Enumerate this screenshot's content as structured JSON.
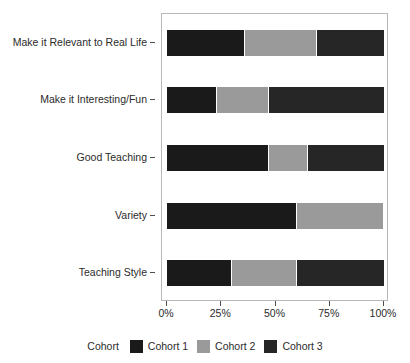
{
  "chart_data": {
    "type": "bar",
    "orientation": "horizontal",
    "stacked": true,
    "normalized_percent": true,
    "title": "",
    "subtitle": "",
    "xlabel": "",
    "ylabel": "",
    "categories": [
      "Make it Relevant to Real Life",
      "Make it Interesting/Fun",
      "Good Teaching",
      "Variety",
      "Teaching Style"
    ],
    "series": [
      {
        "name": "Cohort 1",
        "color": "#1a1a1a",
        "values": [
          36,
          23,
          47,
          60,
          30
        ]
      },
      {
        "name": "Cohort 2",
        "color": "#9a9a9a",
        "values": [
          33,
          24,
          18,
          40,
          30
        ]
      },
      {
        "name": "Cohort 3",
        "color": "#262626",
        "values": [
          31,
          53,
          35,
          0,
          40
        ]
      }
    ],
    "xlim": [
      0,
      100
    ],
    "xticks": [
      0,
      25,
      50,
      75,
      100
    ],
    "xticklabels": [
      "0%",
      "25%",
      "50%",
      "75%",
      "100%"
    ],
    "grid": false,
    "legend": {
      "title": "Cohort",
      "position": "bottom",
      "orientation": "horizontal"
    }
  },
  "legend": {
    "title": "Cohort",
    "entries": [
      {
        "label": "Cohort 1",
        "color": "#1a1a1a"
      },
      {
        "label": "Cohort 2",
        "color": "#9a9a9a"
      },
      {
        "label": "Cohort 3",
        "color": "#262626"
      }
    ]
  },
  "axes": {
    "x_tick_labels": [
      "0%",
      "25%",
      "50%",
      "75%",
      "100%"
    ],
    "y_tick_labels": [
      "Make it Relevant to Real Life",
      "Make it Interesting/Fun",
      "Good Teaching",
      "Variety",
      "Teaching Style"
    ]
  }
}
